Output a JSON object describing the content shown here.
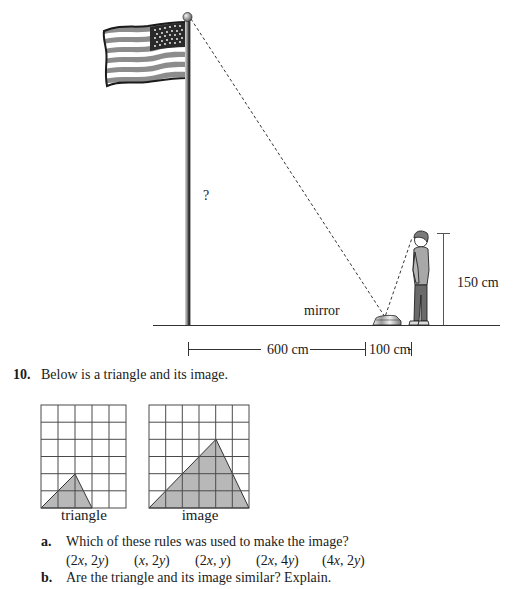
{
  "diagram": {
    "unknown_label": "?",
    "mirror_label": "mirror",
    "height_label": "150 cm",
    "distance_left_label": "600 cm",
    "distance_right_label": "100 cm",
    "objects": [
      "flagpole-with-flag",
      "mirror",
      "boy"
    ]
  },
  "question": {
    "number": "10.",
    "prompt": "Below is a triangle and its image.",
    "grids": [
      {
        "caption": "triangle",
        "cols": 5,
        "rows": 6,
        "vertices": [
          [
            0,
            0
          ],
          [
            2,
            2
          ],
          [
            3,
            0
          ]
        ]
      },
      {
        "caption": "image",
        "cols": 6,
        "rows": 6,
        "vertices": [
          [
            0,
            0
          ],
          [
            4,
            4
          ],
          [
            6,
            0
          ]
        ]
      }
    ],
    "parts": [
      {
        "letter": "a.",
        "text": "Which of these rules was used to make the image?",
        "options": [
          "(2x, 2y)",
          "(x, 2y)",
          "(2x, y)",
          "(2x, 4y)",
          "(4x, 2y)"
        ]
      },
      {
        "letter": "b.",
        "text": "Are the triangle and its image similar? Explain."
      }
    ]
  },
  "colors": {
    "ink": "#1a1a1a",
    "shade": "#b8b8b8",
    "grid": "#4a4a4a"
  }
}
